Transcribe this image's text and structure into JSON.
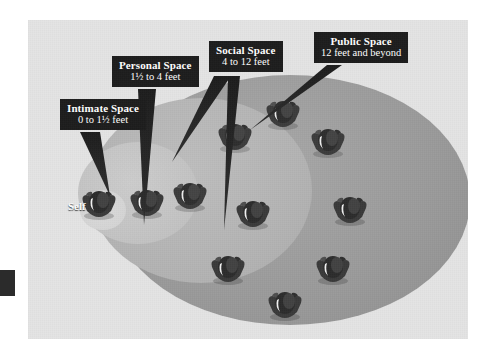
{
  "diagram": {
    "background_color": "#e4e4e4",
    "page_color": "#ffffff"
  },
  "zones": [
    {
      "key": "intimate",
      "name": "Intimate Space",
      "distance": "0 to 1½ feet",
      "fill": "#d6d6d6"
    },
    {
      "key": "personal",
      "name": "Personal Space",
      "distance": "1½ to 4 feet",
      "fill": "#c6c6c6"
    },
    {
      "key": "social",
      "name": "Social Space",
      "distance": "4 to 12 feet",
      "fill": "#b6b6b6"
    },
    {
      "key": "public",
      "name": "Public Space",
      "distance": "12 feet and beyond",
      "fill": "#9d9d9d"
    }
  ],
  "callouts": {
    "intimate": {
      "line1": "Intimate Space",
      "line2": "0 to 1½ feet"
    },
    "personal": {
      "line1": "Personal Space",
      "line2": "1½ to 4 feet"
    },
    "social": {
      "line1": "Social Space",
      "line2": "4 to 12 feet"
    },
    "public": {
      "line1": "Public Space",
      "line2": "12 feet and beyond"
    }
  },
  "self_marker": {
    "label": "Self",
    "color": "#ffffff"
  },
  "figures": [
    {
      "id": "self",
      "zone": "intimate",
      "x": 71,
      "y": 180,
      "scale": 1.0
    },
    {
      "id": "p1",
      "zone": "personal",
      "x": 119,
      "y": 179,
      "scale": 1.0
    },
    {
      "id": "p2",
      "zone": "social",
      "x": 162,
      "y": 172,
      "scale": 0.98
    },
    {
      "id": "s1",
      "zone": "social",
      "x": 207,
      "y": 113,
      "scale": 0.96
    },
    {
      "id": "s2",
      "zone": "social",
      "x": 225,
      "y": 190,
      "scale": 1.0
    },
    {
      "id": "s3",
      "zone": "social",
      "x": 200,
      "y": 245,
      "scale": 1.0
    },
    {
      "id": "u1",
      "zone": "public",
      "x": 255,
      "y": 90,
      "scale": 0.96
    },
    {
      "id": "u2",
      "zone": "public",
      "x": 300,
      "y": 118,
      "scale": 0.98
    },
    {
      "id": "u3",
      "zone": "public",
      "x": 322,
      "y": 186,
      "scale": 1.02
    },
    {
      "id": "u4",
      "zone": "public",
      "x": 305,
      "y": 245,
      "scale": 1.0
    },
    {
      "id": "u5",
      "zone": "public",
      "x": 257,
      "y": 281,
      "scale": 1.0
    }
  ],
  "edge_marker": {
    "name": "page-edge-tab",
    "color": "#2b2b2b"
  }
}
